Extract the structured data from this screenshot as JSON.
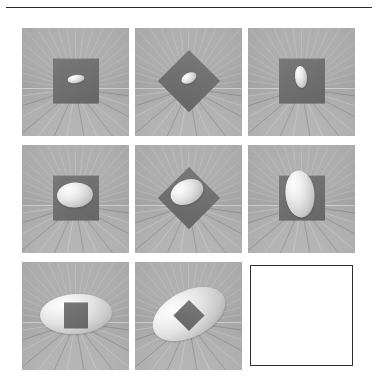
{
  "figure": {
    "title": "",
    "background_color": "#ffffff",
    "rule_color": "#2b2b2b",
    "scene_background_color": "#a9a9a9",
    "plane_color": "#6e6e6e",
    "blob_highlight_color": "#fdfdfd",
    "blob_shadow_color": "#9a9a9a",
    "empty_panel_border_color": "#2f2f2f",
    "empty_panel_fill_color": "#ffffff",
    "rows": 3,
    "columns": 3
  },
  "chart_data": {
    "type": "table",
    "title": "",
    "xlabel": "plane orientation",
    "ylabel": "ellipsoid size",
    "categories": [
      "axis-aligned square",
      "diamond (45 deg)",
      "square, side view"
    ],
    "row_labels": [
      "small ellipsoid",
      "medium ellipsoid",
      "large ellipsoid"
    ],
    "series": [
      {
        "name": "small ellipsoid",
        "values": [
          1,
          1,
          1
        ]
      },
      {
        "name": "medium ellipsoid",
        "values": [
          2,
          2,
          2
        ]
      },
      {
        "name": "large ellipsoid",
        "values": [
          3,
          3,
          3
        ]
      }
    ]
  },
  "panels": [
    {
      "id": "panel-1",
      "row": 1,
      "column": 1,
      "kind": "scene",
      "plane_shape": "square",
      "plane_rotation_deg": 0,
      "blob_width": 17,
      "blob_height": 8,
      "blob_rotation_deg": -8,
      "blob_offset_x": 0,
      "blob_offset_y": -1,
      "blob_in_front": false
    },
    {
      "id": "panel-2",
      "row": 1,
      "column": 2,
      "kind": "scene",
      "plane_shape": "diamond",
      "plane_rotation_deg": 45,
      "blob_width": 16,
      "blob_height": 10,
      "blob_rotation_deg": -28,
      "blob_offset_x": 0,
      "blob_offset_y": -2,
      "blob_in_front": false
    },
    {
      "id": "panel-3",
      "row": 1,
      "column": 3,
      "kind": "scene",
      "plane_shape": "square",
      "plane_rotation_deg": 0,
      "blob_width": 12,
      "blob_height": 22,
      "blob_rotation_deg": -6,
      "blob_offset_x": -1,
      "blob_offset_y": -3,
      "blob_in_front": false
    },
    {
      "id": "panel-4",
      "row": 2,
      "column": 1,
      "kind": "scene",
      "plane_shape": "square",
      "plane_rotation_deg": 0,
      "blob_width": 36,
      "blob_height": 25,
      "blob_rotation_deg": -4,
      "blob_offset_x": -1,
      "blob_offset_y": -2,
      "blob_in_front": false
    },
    {
      "id": "panel-5",
      "row": 2,
      "column": 2,
      "kind": "scene",
      "plane_shape": "diamond",
      "plane_rotation_deg": 45,
      "blob_width": 34,
      "blob_height": 24,
      "blob_rotation_deg": -24,
      "blob_offset_x": -2,
      "blob_offset_y": -5,
      "blob_in_front": false
    },
    {
      "id": "panel-6",
      "row": 2,
      "column": 3,
      "kind": "scene",
      "plane_shape": "square",
      "plane_rotation_deg": 0,
      "blob_width": 29,
      "blob_height": 47,
      "blob_rotation_deg": -5,
      "blob_offset_x": -2,
      "blob_offset_y": -3,
      "blob_in_front": false
    },
    {
      "id": "panel-7",
      "row": 3,
      "column": 1,
      "kind": "scene",
      "plane_shape": "square-small",
      "plane_rotation_deg": 0,
      "blob_width": 72,
      "blob_height": 40,
      "blob_rotation_deg": -3,
      "blob_offset_x": 0,
      "blob_offset_y": 0,
      "blob_in_front": false
    },
    {
      "id": "panel-8",
      "row": 3,
      "column": 2,
      "kind": "scene",
      "plane_shape": "diamond-small",
      "plane_rotation_deg": 45,
      "blob_width": 78,
      "blob_height": 46,
      "blob_rotation_deg": -27,
      "blob_offset_x": 0,
      "blob_offset_y": 0,
      "blob_in_front": false
    },
    {
      "id": "panel-9",
      "row": 3,
      "column": 3,
      "kind": "empty",
      "plane_shape": "none",
      "plane_rotation_deg": 0,
      "blob_width": 0,
      "blob_height": 0,
      "blob_rotation_deg": 0,
      "blob_offset_x": 0,
      "blob_offset_y": 0,
      "blob_in_front": false
    }
  ]
}
